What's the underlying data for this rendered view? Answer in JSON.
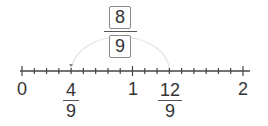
{
  "number_line": {
    "min_label": "0",
    "one_label": "1",
    "max_label": "2",
    "subdivisions_per_unit": 9,
    "marked_points": [
      {
        "numerator": "4",
        "denominator": "9"
      },
      {
        "numerator": "12",
        "denominator": "9"
      }
    ]
  },
  "jump": {
    "numerator_box": "8",
    "denominator_box": "9",
    "from": "4/9",
    "to": "12/9"
  }
}
